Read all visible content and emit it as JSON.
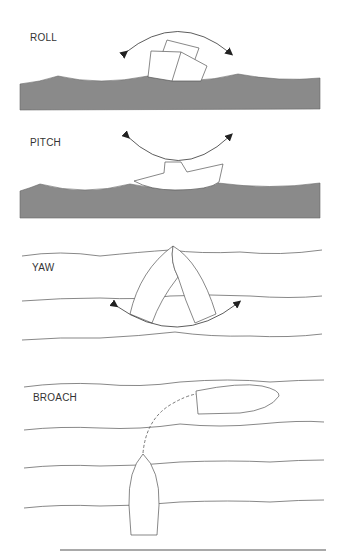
{
  "panels": [
    {
      "id": "roll",
      "label": "ROLL"
    },
    {
      "id": "pitch",
      "label": "PITCH"
    },
    {
      "id": "yaw",
      "label": "YAW"
    },
    {
      "id": "broach",
      "label": "BROACH"
    }
  ],
  "colors": {
    "sea": "#8a8a8a",
    "line": "#555555",
    "arrow": "#222222",
    "hull": "#ffffff"
  }
}
